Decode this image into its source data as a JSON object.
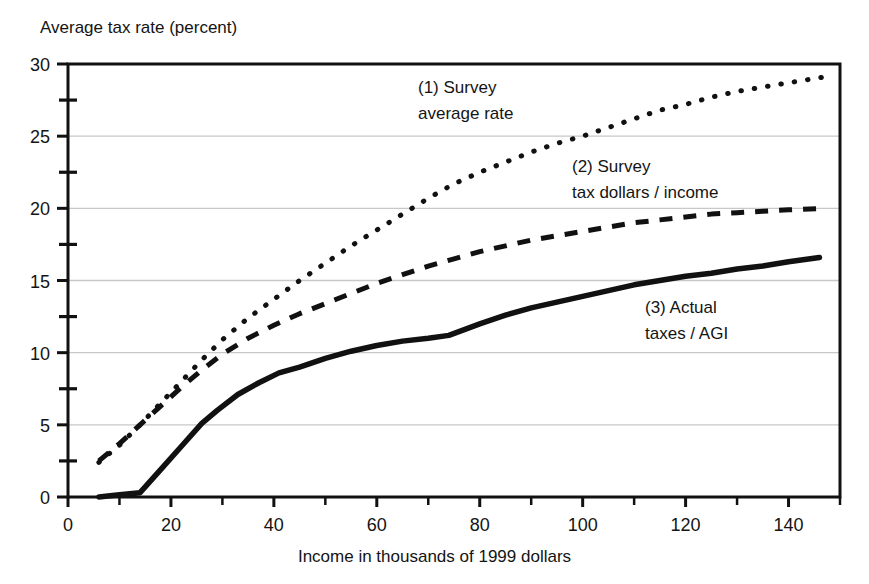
{
  "chart_data": {
    "type": "line",
    "title": "",
    "ylabel": "Average tax rate (percent)",
    "xlabel": "Income in thousands of 1999 dollars",
    "xlim": [
      0,
      150
    ],
    "ylim": [
      0,
      30
    ],
    "xticks": [
      0,
      20,
      40,
      60,
      80,
      100,
      120,
      140
    ],
    "xtick_labels": [
      "0",
      "20",
      "40",
      "60",
      "80",
      "100",
      "120",
      "140"
    ],
    "xminor_ticks": [
      10,
      30,
      50,
      70,
      90,
      110,
      130,
      150
    ],
    "yticks": [
      0,
      5,
      10,
      15,
      20,
      25,
      30
    ],
    "ytick_labels": [
      "0",
      "5",
      "10",
      "15",
      "20",
      "25",
      "30"
    ],
    "yminor_ticks": [
      2.5,
      7.5,
      12.5,
      17.5,
      22.5,
      27.5
    ],
    "grid": "horizontal-major",
    "grid_color": "#c8c8c8",
    "frame": true,
    "frame_color": "#111111",
    "legend_position": "inline-annotations",
    "series": [
      {
        "name": "(1) Survey average rate",
        "key": "survey_average_rate",
        "style": "dotted",
        "color": "#111111",
        "x": [
          6,
          10,
          14,
          18,
          22,
          26,
          30,
          35,
          40,
          45,
          50,
          55,
          60,
          65,
          70,
          75,
          80,
          85,
          90,
          95,
          100,
          105,
          110,
          115,
          120,
          125,
          130,
          135,
          140,
          147
        ],
        "y": [
          2.4,
          3.6,
          5.0,
          6.5,
          8.0,
          9.5,
          10.9,
          12.4,
          13.7,
          15.0,
          16.2,
          17.4,
          18.5,
          19.6,
          20.7,
          21.7,
          22.5,
          23.2,
          23.9,
          24.5,
          25.0,
          25.6,
          26.2,
          26.8,
          27.2,
          27.7,
          28.1,
          28.4,
          28.7,
          29.1
        ]
      },
      {
        "name": "(2) Survey tax dollars / income",
        "key": "survey_tax_dollars_over_income",
        "style": "dashed",
        "color": "#111111",
        "x": [
          6,
          10,
          14,
          18,
          22,
          26,
          30,
          35,
          40,
          45,
          50,
          55,
          60,
          65,
          70,
          75,
          80,
          85,
          90,
          95,
          100,
          105,
          110,
          115,
          120,
          125,
          130,
          135,
          140,
          147
        ],
        "y": [
          2.5,
          3.7,
          5.0,
          6.3,
          7.6,
          8.8,
          9.9,
          11.0,
          11.9,
          12.7,
          13.4,
          14.1,
          14.8,
          15.4,
          16.0,
          16.5,
          17.0,
          17.4,
          17.8,
          18.1,
          18.4,
          18.7,
          19.0,
          19.2,
          19.4,
          19.6,
          19.7,
          19.8,
          19.9,
          20.0
        ]
      },
      {
        "name": "(3) Actual taxes / AGI",
        "key": "actual_taxes_over_agi",
        "style": "solid",
        "color": "#111111",
        "x": [
          6,
          10,
          14,
          18,
          22,
          26,
          29,
          33,
          37,
          41,
          45,
          50,
          55,
          60,
          65,
          70,
          74,
          80,
          85,
          90,
          95,
          100,
          105,
          110,
          115,
          120,
          125,
          130,
          135,
          140,
          146
        ],
        "y": [
          0.0,
          0.15,
          0.3,
          1.9,
          3.5,
          5.1,
          6.0,
          7.1,
          7.9,
          8.6,
          9.0,
          9.6,
          10.1,
          10.5,
          10.8,
          11.0,
          11.2,
          12.0,
          12.6,
          13.1,
          13.5,
          13.9,
          14.3,
          14.7,
          15.0,
          15.3,
          15.5,
          15.8,
          16.0,
          16.3,
          16.6
        ]
      }
    ],
    "annotations": [
      {
        "key": "annot_1",
        "line1": "(1) Survey",
        "line2": "average rate",
        "x_px": 418,
        "y_px": 93
      },
      {
        "key": "annot_2",
        "line1": "(2) Survey",
        "line2": "tax dollars / income",
        "x_px": 572,
        "y_px": 172
      },
      {
        "key": "annot_3",
        "line1": "(3) Actual",
        "line2": "taxes / AGI",
        "x_px": 645,
        "y_px": 313
      }
    ]
  }
}
